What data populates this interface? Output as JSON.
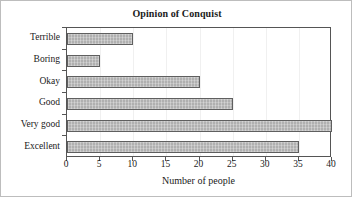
{
  "chart_data": {
    "type": "bar",
    "orientation": "horizontal",
    "title": "Opinion of Conquist",
    "xlabel": "Number of people",
    "ylabel": "",
    "categories": [
      "Terrible",
      "Boring",
      "Okay",
      "Good",
      "Very good",
      "Excellent"
    ],
    "values": [
      10,
      5,
      20,
      25,
      40,
      35
    ],
    "xlim": [
      0,
      40
    ],
    "xticks": [
      0,
      5,
      10,
      15,
      20,
      25,
      30,
      35,
      40
    ],
    "xtick_labels": [
      "0",
      "5",
      "10",
      "15",
      "20",
      "25",
      "30",
      "35",
      "40"
    ],
    "grid": "vertical-light",
    "legend": null,
    "bar_fill_color": "#b0b0b0",
    "bar_edge_color": "#5f5f5f",
    "axis_color": "#555555",
    "background_color": "#ffffff",
    "text_color": "#1a1a1a"
  }
}
